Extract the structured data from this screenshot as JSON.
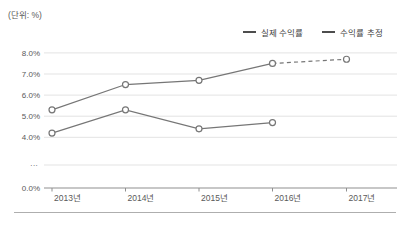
{
  "unit_label": "(단위: %)",
  "legend": [
    {
      "label": "실제 수익률"
    },
    {
      "label": "수익률 추정"
    }
  ],
  "chart_data": {
    "type": "line",
    "categories": [
      "2013년",
      "2014년",
      "2015년",
      "2016년",
      "2017년"
    ],
    "series": [
      {
        "name": "실제 수익률",
        "values": [
          4.2,
          5.3,
          4.4,
          4.7,
          null
        ],
        "dashed_from_index": null
      },
      {
        "name": "수익률 추정",
        "values": [
          5.3,
          6.5,
          6.7,
          7.5,
          7.7
        ],
        "dashed_from_index": 3
      }
    ],
    "y_axis": {
      "ticks": [
        {
          "label": "8.0%",
          "value": 8
        },
        {
          "label": "7.0%",
          "value": 7
        },
        {
          "label": "6.0%",
          "value": 6
        },
        {
          "label": "5.0%",
          "value": 5
        },
        {
          "label": "4.0%",
          "value": 4
        }
      ],
      "break_label": "···",
      "zero_label": "0.0%",
      "has_break": true,
      "display_range": [
        4.0,
        8.0
      ]
    },
    "grid": true,
    "legend_position": "top-right",
    "colors": {
      "line": "#767676",
      "marker_fill": "#ffffff",
      "grid": "#e3e3e3",
      "axis": "#8f8f8f",
      "text": "#595959"
    }
  }
}
